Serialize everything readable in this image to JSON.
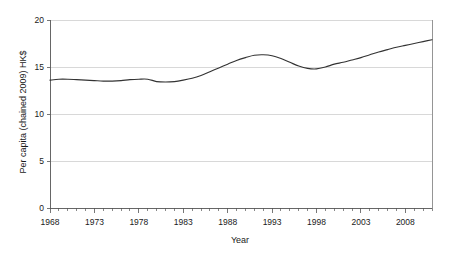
{
  "chart_data": {
    "type": "line",
    "title": "",
    "xlabel": "Year",
    "ylabel": "Per capita (chained 2009) HK$",
    "xlim": [
      1968,
      2011
    ],
    "ylim": [
      0,
      20
    ],
    "grid": true,
    "legend": "none",
    "y_ticks": [
      0,
      5,
      10,
      15,
      20
    ],
    "y_tick_labels": [
      "0",
      "5",
      "10",
      "15",
      "20"
    ],
    "x_ticks": [
      1968,
      1973,
      1978,
      1983,
      1988,
      1993,
      1998,
      2003,
      2008
    ],
    "x_tick_labels": [
      "1968",
      "1973",
      "1978",
      "1983",
      "1988",
      "1993",
      "1998",
      "2003",
      "2008"
    ],
    "x_minor_tick_interval": 1,
    "series": [
      {
        "name": "Per capita (chained 2009) HK$",
        "color": "#333333",
        "x": [
          1968,
          1969,
          1970,
          1971,
          1972,
          1973,
          1974,
          1975,
          1976,
          1977,
          1978,
          1979,
          1980,
          1981,
          1982,
          1983,
          1984,
          1985,
          1986,
          1987,
          1988,
          1989,
          1990,
          1991,
          1992,
          1993,
          1994,
          1995,
          1996,
          1997,
          1998,
          1999,
          2000,
          2001,
          2002,
          2003,
          2004,
          2005,
          2006,
          2007,
          2008,
          2009,
          2010,
          2011
        ],
        "values": [
          13.6,
          13.7,
          13.7,
          13.65,
          13.6,
          13.55,
          13.5,
          13.5,
          13.55,
          13.65,
          13.7,
          13.7,
          13.45,
          13.4,
          13.45,
          13.6,
          13.8,
          14.1,
          14.5,
          14.9,
          15.3,
          15.7,
          16.0,
          16.25,
          16.3,
          16.2,
          15.9,
          15.5,
          15.1,
          14.85,
          14.8,
          15.0,
          15.3,
          15.5,
          15.75,
          16.0,
          16.3,
          16.6,
          16.85,
          17.1,
          17.3,
          17.5,
          17.7,
          17.9
        ]
      }
    ]
  },
  "axis": {
    "y_title": "Per capita (chained 2009) HK$",
    "x_title": "Year"
  }
}
